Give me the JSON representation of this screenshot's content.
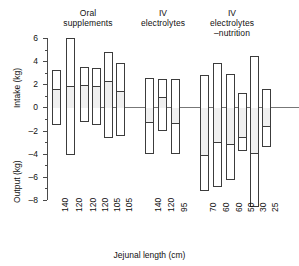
{
  "figure": {
    "xlabel": "Jejunal length (cm)",
    "ylabel_top": "Intake (kg)",
    "ylabel_bottom": "Output (kg)"
  },
  "groups": [
    {
      "name": "oral-supplements",
      "title": "Oral\nsupplements"
    },
    {
      "name": "iv-electrolytes",
      "title": "IV\nelectrolytes"
    },
    {
      "name": "iv-electrolytes-nutrition",
      "title": "IV\nelectrolytes\n–nutrition"
    }
  ],
  "yticks": [
    {
      "label": "6",
      "value": 6
    },
    {
      "label": "4",
      "value": 4
    },
    {
      "label": "2",
      "value": 2
    },
    {
      "label": "0",
      "value": 0
    },
    {
      "label": "–2",
      "value": -2
    },
    {
      "label": "–4",
      "value": -4
    },
    {
      "label": "–6",
      "value": -6
    },
    {
      "label": "–8",
      "value": -8
    }
  ],
  "chart_data": {
    "type": "bar",
    "title": "",
    "subtitle": "",
    "xlabel": "Jejunal length (cm)",
    "ylabel": "Intake (kg) / Output (kg)",
    "ylim": [
      -8,
      6
    ],
    "ytick_step": 2,
    "yminor_step": 1,
    "grid": false,
    "legend": "none",
    "zero_reference_line": 0,
    "categories": [
      "140",
      "120",
      "120",
      "120",
      "105",
      "105",
      "140",
      "120",
      "95",
      "70",
      "60",
      "60",
      "50",
      "30",
      "25"
    ],
    "groups": [
      "Oral supplements",
      "Oral supplements",
      "Oral supplements",
      "Oral supplements",
      "Oral supplements",
      "Oral supplements",
      "IV electrolytes",
      "IV electrolytes",
      "IV electrolytes",
      "IV electrolytes –nutrition",
      "IV electrolytes –nutrition",
      "IV electrolytes –nutrition",
      "IV electrolytes –nutrition",
      "IV electrolytes –nutrition",
      "IV electrolytes –nutrition"
    ],
    "series": [
      {
        "name": "Intake (kg)",
        "values": [
          3.2,
          6.0,
          3.5,
          3.4,
          4.8,
          3.8,
          2.55,
          2.5,
          2.5,
          2.8,
          3.8,
          2.9,
          1.25,
          4.45,
          1.6
        ]
      },
      {
        "name": "Output (kg)",
        "values": [
          -1.5,
          -4.1,
          -1.3,
          -1.5,
          -2.6,
          -2.5,
          -4.05,
          -2.0,
          -4.05,
          -7.2,
          -6.9,
          -6.3,
          -3.8,
          -8.6,
          -3.4
        ]
      },
      {
        "name": "Mid level",
        "values": [
          1.65,
          1.9,
          2.05,
          1.95,
          2.35,
          1.5,
          -1.2,
          0.95,
          -1.25,
          -4.05,
          -2.9,
          -3.1,
          -2.45,
          -3.85,
          -1.5
        ]
      }
    ]
  },
  "bars": [
    {
      "group": 0,
      "label": "140",
      "top": 3.2,
      "bottom": -1.5,
      "mid": 1.65
    },
    {
      "group": 0,
      "label": "120",
      "top": 6.0,
      "bottom": -4.1,
      "mid": 1.9
    },
    {
      "group": 0,
      "label": "120",
      "top": 3.5,
      "bottom": -1.3,
      "mid": 2.05
    },
    {
      "group": 0,
      "label": "120",
      "top": 3.4,
      "bottom": -1.5,
      "mid": 1.95
    },
    {
      "group": 0,
      "label": "105",
      "top": 4.8,
      "bottom": -2.6,
      "mid": 2.35
    },
    {
      "group": 0,
      "label": "105",
      "top": 3.8,
      "bottom": -2.5,
      "mid": 1.5
    },
    {
      "group": 1,
      "label": "140",
      "top": 2.55,
      "bottom": -4.05,
      "mid": -1.2
    },
    {
      "group": 1,
      "label": "120",
      "top": 2.5,
      "bottom": -2.0,
      "mid": 0.95
    },
    {
      "group": 1,
      "label": "95",
      "top": 2.5,
      "bottom": -4.05,
      "mid": -1.25
    },
    {
      "group": 2,
      "label": "70",
      "top": 2.8,
      "bottom": -7.2,
      "mid": -4.05
    },
    {
      "group": 2,
      "label": "60",
      "top": 3.8,
      "bottom": -6.9,
      "mid": -2.9
    },
    {
      "group": 2,
      "label": "60",
      "top": 2.9,
      "bottom": -6.3,
      "mid": -3.1
    },
    {
      "group": 2,
      "label": "50",
      "top": 1.25,
      "bottom": -3.8,
      "mid": -2.45
    },
    {
      "group": 2,
      "label": "30",
      "top": 4.45,
      "bottom": -8.6,
      "mid": -3.85
    },
    {
      "group": 2,
      "label": "25",
      "top": 1.6,
      "bottom": -3.4,
      "mid": -1.5
    }
  ],
  "bar_x": [
    52,
    66,
    80,
    92,
    104,
    116,
    145,
    158,
    171,
    200,
    213,
    226,
    238,
    250,
    262
  ]
}
